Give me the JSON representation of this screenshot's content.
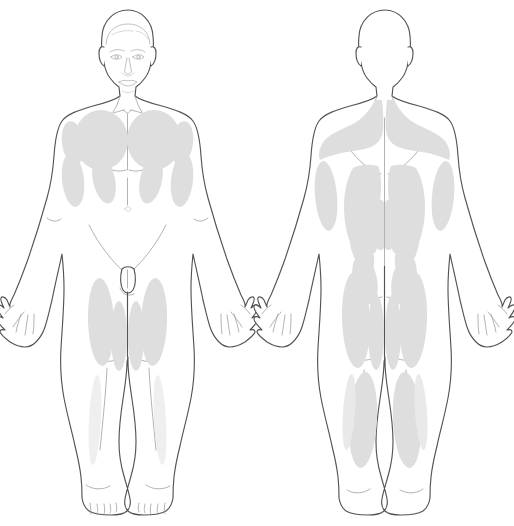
{
  "document": {
    "type": "anatomical-body-map",
    "title": "Muscle Region Body Map",
    "background_color": "#ffffff",
    "width": 514,
    "height": 526
  },
  "colors": {
    "outline": "#545454",
    "inner_line": "#9a9a9a",
    "highlight_fill": "#dedede",
    "highlight_soft": "#e9e9e9",
    "highlight_faint": "#efefef",
    "background": "#ffffff"
  },
  "figures": [
    {
      "id": "anterior",
      "label": "Anterior (front) view",
      "position": "left",
      "has_facial_features": true,
      "regions": [
        {
          "name": "right-pectoral",
          "side": "right",
          "group": "chest"
        },
        {
          "name": "left-pectoral",
          "side": "left",
          "group": "chest"
        },
        {
          "name": "right-deltoid",
          "side": "right",
          "group": "shoulder"
        },
        {
          "name": "left-deltoid",
          "side": "left",
          "group": "shoulder"
        },
        {
          "name": "right-biceps",
          "side": "right",
          "group": "upper-arm"
        },
        {
          "name": "left-biceps",
          "side": "left",
          "group": "upper-arm"
        },
        {
          "name": "right-oblique",
          "side": "right",
          "group": "abdomen"
        },
        {
          "name": "left-oblique",
          "side": "left",
          "group": "abdomen"
        },
        {
          "name": "right-quadriceps-lateral",
          "side": "right",
          "group": "thigh"
        },
        {
          "name": "right-quadriceps-medial",
          "side": "right",
          "group": "thigh"
        },
        {
          "name": "left-quadriceps-lateral",
          "side": "left",
          "group": "thigh"
        },
        {
          "name": "left-quadriceps-medial",
          "side": "left",
          "group": "thigh"
        },
        {
          "name": "right-tibialis",
          "side": "right",
          "group": "lower-leg"
        },
        {
          "name": "left-tibialis",
          "side": "left",
          "group": "lower-leg"
        }
      ]
    },
    {
      "id": "posterior",
      "label": "Posterior (back) view",
      "position": "right",
      "has_facial_features": false,
      "regions": [
        {
          "name": "right-trapezius",
          "side": "right",
          "group": "upper-back"
        },
        {
          "name": "left-trapezius",
          "side": "left",
          "group": "upper-back"
        },
        {
          "name": "right-latissimus",
          "side": "right",
          "group": "mid-back"
        },
        {
          "name": "left-latissimus",
          "side": "left",
          "group": "mid-back"
        },
        {
          "name": "right-erector-spinae",
          "side": "right",
          "group": "spine"
        },
        {
          "name": "left-erector-spinae",
          "side": "left",
          "group": "spine"
        },
        {
          "name": "right-erector-spinae-inner",
          "side": "right",
          "group": "spine"
        },
        {
          "name": "left-erector-spinae-inner",
          "side": "left",
          "group": "spine"
        },
        {
          "name": "right-triceps",
          "side": "right",
          "group": "upper-arm"
        },
        {
          "name": "left-triceps",
          "side": "left",
          "group": "upper-arm"
        },
        {
          "name": "right-lower-back",
          "side": "right",
          "group": "lumbar"
        },
        {
          "name": "left-lower-back",
          "side": "left",
          "group": "lumbar"
        },
        {
          "name": "right-gluteal",
          "side": "right",
          "group": "buttock"
        },
        {
          "name": "left-gluteal",
          "side": "left",
          "group": "buttock"
        },
        {
          "name": "right-hamstring-lateral",
          "side": "right",
          "group": "thigh"
        },
        {
          "name": "right-hamstring-medial",
          "side": "right",
          "group": "thigh"
        },
        {
          "name": "left-hamstring-lateral",
          "side": "left",
          "group": "thigh"
        },
        {
          "name": "left-hamstring-medial",
          "side": "left",
          "group": "thigh"
        },
        {
          "name": "right-gastrocnemius",
          "side": "right",
          "group": "calf"
        },
        {
          "name": "left-gastrocnemius",
          "side": "left",
          "group": "calf"
        }
      ]
    }
  ]
}
